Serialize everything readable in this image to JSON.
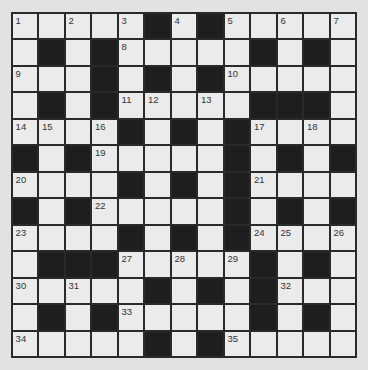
{
  "puzzle": {
    "rows": 13,
    "cols": 13,
    "colors": {
      "background": "#e2e2e2",
      "cell": "#ebebeb",
      "block": "#1e1e1e",
      "gridline": "#2a2a2a"
    },
    "layout": [
      ".....#.#.....",
      ".#.#.....#.#.",
      "...#.#.#.....",
      ".#.#.....###.",
      "....#.#.#....",
      "#.#.....#.#.#",
      "....#.#.#....",
      "#.#.....#.#.#",
      "....#.#.#....",
      ".###.....#.#.",
      ".....#.#.#...",
      ".#.#.....#.#.",
      ".....#.#....."
    ],
    "numbers": [
      {
        "r": 0,
        "c": 0,
        "n": "1"
      },
      {
        "r": 0,
        "c": 2,
        "n": "2"
      },
      {
        "r": 0,
        "c": 4,
        "n": "3"
      },
      {
        "r": 0,
        "c": 6,
        "n": "4"
      },
      {
        "r": 0,
        "c": 8,
        "n": "5"
      },
      {
        "r": 0,
        "c": 10,
        "n": "6"
      },
      {
        "r": 0,
        "c": 12,
        "n": "7"
      },
      {
        "r": 1,
        "c": 4,
        "n": "8"
      },
      {
        "r": 2,
        "c": 0,
        "n": "9"
      },
      {
        "r": 2,
        "c": 8,
        "n": "10"
      },
      {
        "r": 3,
        "c": 4,
        "n": "11"
      },
      {
        "r": 3,
        "c": 5,
        "n": "12"
      },
      {
        "r": 3,
        "c": 7,
        "n": "13"
      },
      {
        "r": 4,
        "c": 0,
        "n": "14"
      },
      {
        "r": 4,
        "c": 1,
        "n": "15"
      },
      {
        "r": 4,
        "c": 3,
        "n": "16"
      },
      {
        "r": 4,
        "c": 9,
        "n": "17"
      },
      {
        "r": 4,
        "c": 11,
        "n": "18"
      },
      {
        "r": 5,
        "c": 3,
        "n": "19"
      },
      {
        "r": 6,
        "c": 0,
        "n": "20"
      },
      {
        "r": 6,
        "c": 9,
        "n": "21"
      },
      {
        "r": 7,
        "c": 3,
        "n": "22"
      },
      {
        "r": 8,
        "c": 0,
        "n": "23"
      },
      {
        "r": 8,
        "c": 9,
        "n": "24"
      },
      {
        "r": 8,
        "c": 10,
        "n": "25"
      },
      {
        "r": 8,
        "c": 12,
        "n": "26"
      },
      {
        "r": 9,
        "c": 4,
        "n": "27"
      },
      {
        "r": 9,
        "c": 6,
        "n": "28"
      },
      {
        "r": 9,
        "c": 8,
        "n": "29"
      },
      {
        "r": 10,
        "c": 0,
        "n": "30"
      },
      {
        "r": 10,
        "c": 2,
        "n": "31"
      },
      {
        "r": 10,
        "c": 10,
        "n": "32"
      },
      {
        "r": 11,
        "c": 4,
        "n": "33"
      },
      {
        "r": 12,
        "c": 0,
        "n": "34"
      },
      {
        "r": 12,
        "c": 8,
        "n": "35"
      }
    ]
  }
}
